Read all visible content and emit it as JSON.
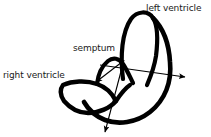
{
  "figure": {
    "background_color": "#ffffff",
    "stroke_color": "#000000",
    "text_color": "#1a1a1a",
    "width": 211,
    "height": 137
  },
  "labels": {
    "left_ventricle": "left ventricle",
    "semptum": "semptum",
    "right_ventricle": "right ventricle"
  },
  "diagram_data": {
    "type": "diagram",
    "subject": "heart cross-section (hand-drawn)",
    "structures": [
      {
        "name": "left ventricle",
        "shape": "tall inverted-U loop",
        "label": "left ventricle",
        "label_position": [
          146,
          3
        ]
      },
      {
        "name": "right ventricle",
        "shape": "crescent",
        "label": "right ventricle",
        "label_position": [
          3,
          70
        ]
      },
      {
        "name": "semptum",
        "shape": "zigzag peak between ventricles",
        "label": "semptum",
        "label_position": [
          73,
          43
        ]
      }
    ],
    "arrows": [
      {
        "name": "semptum-arrow",
        "from": [
          120,
          63
        ],
        "to": [
          96,
          82
        ],
        "direction": "down-left"
      },
      {
        "name": "right-arrow",
        "from": [
          108,
          66
        ],
        "to": [
          186,
          77
        ],
        "direction": "right"
      },
      {
        "name": "down-arrow",
        "from": [
          123,
          62
        ],
        "to": [
          105,
          133
        ],
        "direction": "down"
      }
    ]
  }
}
